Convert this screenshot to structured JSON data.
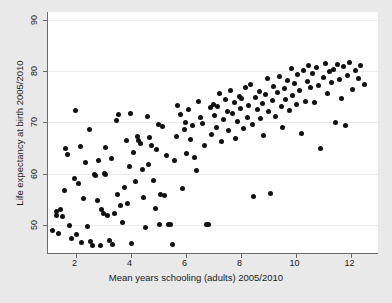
{
  "chart_data": {
    "type": "scatter",
    "title": "",
    "xlabel": "Mean years schooling (adults) 2005/2010",
    "ylabel": "Life expectancy at birth 2005/2010",
    "xlim": [
      1.0,
      13.0
    ],
    "ylim": [
      44.5,
      91.5
    ],
    "xticks": [
      2,
      4,
      6,
      8,
      10,
      12
    ],
    "yticks": [
      50,
      60,
      70,
      80,
      90
    ],
    "xtick_labels": [
      "2",
      "4",
      "6",
      "8",
      "10",
      "12"
    ],
    "ytick_labels": [
      "50",
      "60",
      "70",
      "80",
      "90"
    ],
    "grid": "horizontal",
    "legend": null,
    "marker": {
      "shape": "circle",
      "color": "#111111",
      "size": 5
    },
    "background": {
      "figure": "#e9e9e9",
      "axes": "#ffffff",
      "gridline": "#ebebeb",
      "axisline": "#6b6b6b"
    },
    "n_points": 176,
    "points": [
      [
        1.18,
        48.8
      ],
      [
        1.3,
        52.6
      ],
      [
        1.32,
        51.9
      ],
      [
        1.38,
        48.4
      ],
      [
        1.45,
        53.0
      ],
      [
        1.52,
        51.6
      ],
      [
        1.6,
        56.6
      ],
      [
        1.62,
        64.9
      ],
      [
        1.7,
        63.8
      ],
      [
        1.78,
        49.9
      ],
      [
        1.85,
        47.3
      ],
      [
        1.95,
        59.0
      ],
      [
        2.0,
        72.2
      ],
      [
        2.05,
        48.2
      ],
      [
        2.1,
        58.0
      ],
      [
        2.18,
        65.2
      ],
      [
        2.22,
        46.6
      ],
      [
        2.3,
        55.1
      ],
      [
        2.38,
        62.1
      ],
      [
        2.42,
        49.7
      ],
      [
        2.5,
        68.5
      ],
      [
        2.55,
        46.8
      ],
      [
        2.62,
        45.9
      ],
      [
        2.7,
        59.9
      ],
      [
        2.74,
        59.7
      ],
      [
        2.8,
        54.8
      ],
      [
        2.85,
        62.5
      ],
      [
        2.9,
        46.0
      ],
      [
        2.95,
        52.9
      ],
      [
        3.0,
        52.3
      ],
      [
        3.05,
        60.1
      ],
      [
        3.08,
        59.9
      ],
      [
        3.1,
        65.1
      ],
      [
        3.15,
        51.8
      ],
      [
        3.22,
        47.0
      ],
      [
        3.3,
        63.0
      ],
      [
        3.35,
        46.1
      ],
      [
        3.4,
        52.2
      ],
      [
        3.48,
        70.3
      ],
      [
        3.52,
        55.9
      ],
      [
        3.58,
        71.6
      ],
      [
        3.62,
        53.7
      ],
      [
        3.7,
        50.5
      ],
      [
        3.78,
        57.3
      ],
      [
        3.85,
        66.4
      ],
      [
        3.9,
        54.2
      ],
      [
        3.95,
        61.4
      ],
      [
        4.0,
        71.7
      ],
      [
        4.05,
        46.3
      ],
      [
        4.1,
        64.1
      ],
      [
        4.18,
        58.5
      ],
      [
        4.25,
        67.3
      ],
      [
        4.3,
        66.5
      ],
      [
        4.35,
        65.8
      ],
      [
        4.42,
        60.8
      ],
      [
        4.48,
        55.4
      ],
      [
        4.55,
        49.5
      ],
      [
        4.6,
        71.2
      ],
      [
        4.65,
        61.8
      ],
      [
        4.7,
        67.0
      ],
      [
        4.78,
        65.4
      ],
      [
        4.85,
        58.7
      ],
      [
        4.9,
        53.1
      ],
      [
        4.95,
        64.6
      ],
      [
        5.0,
        69.6
      ],
      [
        5.05,
        50.0
      ],
      [
        5.1,
        56.0
      ],
      [
        5.18,
        69.2
      ],
      [
        5.22,
        55.8
      ],
      [
        5.3,
        63.6
      ],
      [
        5.38,
        50.1
      ],
      [
        5.45,
        50.0
      ],
      [
        5.52,
        46.1
      ],
      [
        5.6,
        62.5
      ],
      [
        5.68,
        67.2
      ],
      [
        5.72,
        73.3
      ],
      [
        5.8,
        71.6
      ],
      [
        5.88,
        57.0
      ],
      [
        5.95,
        68.6
      ],
      [
        6.0,
        70.0
      ],
      [
        6.05,
        64.0
      ],
      [
        6.12,
        72.5
      ],
      [
        6.18,
        66.7
      ],
      [
        6.25,
        69.4
      ],
      [
        6.32,
        63.2
      ],
      [
        6.4,
        60.6
      ],
      [
        6.48,
        74.0
      ],
      [
        6.55,
        71.0
      ],
      [
        6.6,
        69.8
      ],
      [
        6.68,
        65.5
      ],
      [
        6.75,
        50.1
      ],
      [
        6.82,
        50.0
      ],
      [
        6.9,
        72.8
      ],
      [
        6.95,
        67.7
      ],
      [
        7.0,
        73.5
      ],
      [
        7.05,
        71.4
      ],
      [
        7.12,
        69.0
      ],
      [
        7.18,
        73.0
      ],
      [
        7.25,
        75.6
      ],
      [
        7.3,
        66.2
      ],
      [
        7.38,
        70.6
      ],
      [
        7.45,
        74.4
      ],
      [
        7.52,
        72.0
      ],
      [
        7.58,
        68.4
      ],
      [
        7.62,
        76.2
      ],
      [
        7.7,
        71.8
      ],
      [
        7.78,
        73.8
      ],
      [
        7.82,
        66.8
      ],
      [
        7.88,
        70.2
      ],
      [
        7.95,
        75.0
      ],
      [
        8.0,
        72.6
      ],
      [
        8.05,
        74.6
      ],
      [
        8.12,
        68.8
      ],
      [
        8.18,
        76.8
      ],
      [
        8.25,
        71.0
      ],
      [
        8.3,
        73.2
      ],
      [
        8.38,
        77.4
      ],
      [
        8.42,
        69.6
      ],
      [
        8.48,
        55.5
      ],
      [
        8.55,
        74.8
      ],
      [
        8.6,
        72.4
      ],
      [
        8.68,
        76.0
      ],
      [
        8.72,
        70.8
      ],
      [
        8.8,
        73.6
      ],
      [
        8.85,
        67.5
      ],
      [
        8.92,
        75.4
      ],
      [
        8.98,
        78.6
      ],
      [
        9.02,
        72.0
      ],
      [
        9.08,
        56.2
      ],
      [
        9.15,
        74.2
      ],
      [
        9.2,
        77.0
      ],
      [
        9.28,
        71.2
      ],
      [
        9.35,
        75.8
      ],
      [
        9.4,
        79.0
      ],
      [
        9.48,
        73.0
      ],
      [
        9.52,
        69.0
      ],
      [
        9.6,
        76.6
      ],
      [
        9.65,
        74.4
      ],
      [
        9.72,
        78.2
      ],
      [
        9.78,
        72.2
      ],
      [
        9.85,
        80.4
      ],
      [
        9.9,
        75.2
      ],
      [
        9.95,
        77.6
      ],
      [
        10.02,
        73.4
      ],
      [
        10.08,
        79.4
      ],
      [
        10.15,
        76.2
      ],
      [
        10.22,
        67.8
      ],
      [
        10.28,
        80.0
      ],
      [
        10.35,
        74.0
      ],
      [
        10.42,
        78.0
      ],
      [
        10.48,
        81.0
      ],
      [
        10.55,
        76.8
      ],
      [
        10.62,
        79.6
      ],
      [
        10.7,
        73.8
      ],
      [
        10.78,
        80.6
      ],
      [
        10.85,
        77.2
      ],
      [
        10.92,
        64.8
      ],
      [
        11.0,
        78.8
      ],
      [
        11.08,
        81.4
      ],
      [
        11.15,
        75.6
      ],
      [
        11.22,
        79.8
      ],
      [
        11.3,
        77.8
      ],
      [
        11.38,
        80.2
      ],
      [
        11.45,
        70.0
      ],
      [
        11.52,
        81.2
      ],
      [
        11.6,
        78.4
      ],
      [
        11.68,
        74.6
      ],
      [
        11.75,
        80.8
      ],
      [
        11.82,
        69.4
      ],
      [
        11.9,
        79.2
      ],
      [
        11.98,
        81.6
      ],
      [
        12.08,
        76.4
      ],
      [
        12.18,
        80.0
      ],
      [
        12.28,
        78.6
      ],
      [
        12.38,
        81.0
      ],
      [
        12.5,
        77.4
      ]
    ]
  }
}
